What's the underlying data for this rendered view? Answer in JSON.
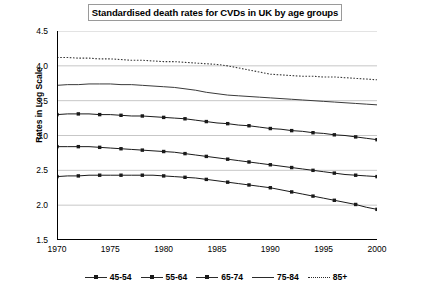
{
  "chart_data": {
    "type": "line",
    "title": "Standardised death rates for CVDs in UK by age groups",
    "xlabel": "",
    "ylabel": "Rates in Log Scale",
    "xlim": [
      1970,
      2000
    ],
    "ylim": [
      1.5,
      4.5
    ],
    "y_ticks": [
      "1.5",
      "2.0",
      "2.5",
      "3.0",
      "3.5",
      "4.0",
      "4.5"
    ],
    "x_ticks": [
      "1970",
      "1975",
      "1980",
      "1985",
      "1990",
      "1995",
      "2000"
    ],
    "x_minor_tick_step": 1,
    "grid": "horizontal",
    "legend_position": "bottom",
    "x": [
      1970,
      1971,
      1972,
      1973,
      1974,
      1975,
      1976,
      1977,
      1978,
      1979,
      1980,
      1981,
      1982,
      1983,
      1984,
      1985,
      1986,
      1987,
      1988,
      1989,
      1990,
      1991,
      1992,
      1993,
      1994,
      1995,
      1996,
      1997,
      1998,
      1999,
      2000
    ],
    "series": [
      {
        "name": "45-54",
        "style": "solid-marker",
        "color": "#1a1a1a",
        "values": [
          2.41,
          2.42,
          2.42,
          2.43,
          2.43,
          2.43,
          2.43,
          2.43,
          2.43,
          2.43,
          2.42,
          2.41,
          2.4,
          2.39,
          2.37,
          2.35,
          2.33,
          2.31,
          2.29,
          2.27,
          2.25,
          2.22,
          2.19,
          2.16,
          2.13,
          2.1,
          2.07,
          2.04,
          2.01,
          1.97,
          1.94
        ]
      },
      {
        "name": "55-64",
        "style": "solid-marker",
        "color": "#1a1a1a",
        "values": [
          2.84,
          2.84,
          2.84,
          2.84,
          2.83,
          2.82,
          2.81,
          2.8,
          2.79,
          2.78,
          2.77,
          2.76,
          2.74,
          2.72,
          2.7,
          2.68,
          2.66,
          2.64,
          2.62,
          2.6,
          2.58,
          2.56,
          2.54,
          2.52,
          2.5,
          2.48,
          2.46,
          2.44,
          2.43,
          2.42,
          2.41
        ]
      },
      {
        "name": "65-74",
        "style": "solid-marker",
        "color": "#1a1a1a",
        "values": [
          3.3,
          3.31,
          3.31,
          3.31,
          3.3,
          3.3,
          3.29,
          3.28,
          3.28,
          3.27,
          3.26,
          3.25,
          3.24,
          3.22,
          3.2,
          3.18,
          3.17,
          3.15,
          3.14,
          3.12,
          3.1,
          3.09,
          3.07,
          3.06,
          3.04,
          3.03,
          3.01,
          3.0,
          2.98,
          2.96,
          2.94
        ]
      },
      {
        "name": "75-84",
        "style": "solid",
        "color": "#3a3a3a",
        "values": [
          3.72,
          3.73,
          3.73,
          3.74,
          3.74,
          3.74,
          3.73,
          3.73,
          3.72,
          3.71,
          3.7,
          3.69,
          3.67,
          3.65,
          3.62,
          3.6,
          3.58,
          3.57,
          3.56,
          3.55,
          3.54,
          3.53,
          3.52,
          3.51,
          3.5,
          3.49,
          3.48,
          3.47,
          3.46,
          3.45,
          3.44
        ]
      },
      {
        "name": "85+",
        "style": "dotted",
        "color": "#3a3a3a",
        "values": [
          4.12,
          4.12,
          4.11,
          4.11,
          4.1,
          4.1,
          4.09,
          4.08,
          4.08,
          4.07,
          4.06,
          4.06,
          4.05,
          4.04,
          4.03,
          4.02,
          4.0,
          3.97,
          3.94,
          3.91,
          3.88,
          3.87,
          3.86,
          3.85,
          3.85,
          3.84,
          3.84,
          3.83,
          3.82,
          3.81,
          3.8
        ]
      }
    ]
  }
}
